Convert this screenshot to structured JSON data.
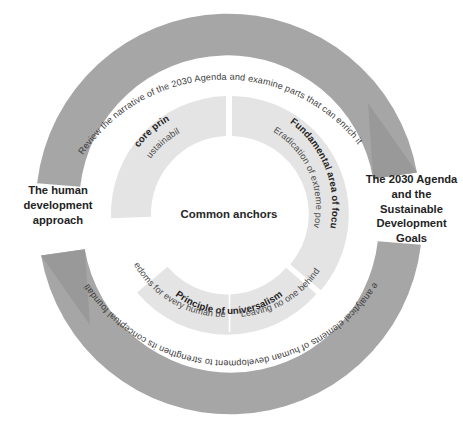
{
  "diagram": {
    "center_label": "Common anchors",
    "side_labels": {
      "left": "The human development approach",
      "right": "The 2030 Agenda and the Sustainable Development Goals"
    },
    "outer_arrows": [
      {
        "id": "top-arrow",
        "text": "Review the narrative of the 2030 Agenda and examine parts that can enrich it",
        "direction": "left-to-right",
        "color": "#a6a6a6",
        "head_color": "#999999"
      },
      {
        "id": "bottom-arrow",
        "text": "Use analytical elements of human development to strengthen its conceptual foundation",
        "direction": "right-to-left",
        "color": "#a6a6a6",
        "head_color": "#999999"
      }
    ],
    "inner_segments": [
      {
        "id": "core-principle",
        "heading": "The core principle",
        "detail": "Sustainability",
        "color": "#e4e4e4"
      },
      {
        "id": "fundamental-area-of-focus",
        "heading": "Fundamental area of focus",
        "detail": "Eradication of extreme poverty, ending hunger ...",
        "color": "#e4e4e4"
      },
      {
        "id": "principle-of-universalism",
        "heading": "Principle of universalism",
        "detail_left": "Freedoms for every human being",
        "detail_right": "Leaving no one behind",
        "color": "#e4e4e4"
      }
    ],
    "colors": {
      "outer_arc": "#a6a6a6",
      "arrow_head": "#999999",
      "inner_ring": "#e4e4e4",
      "text_dark": "#232323",
      "background": "#ffffff"
    }
  }
}
